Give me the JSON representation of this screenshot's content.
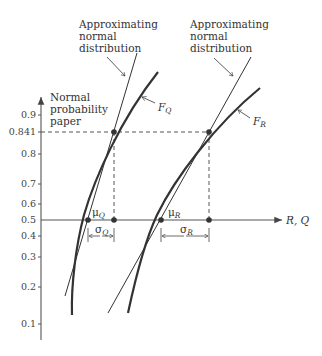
{
  "labels": {
    "approx_left": [
      "Approximating",
      "normal",
      "distribution"
    ],
    "approx_right": [
      "Approximating",
      "normal",
      "distribution"
    ],
    "y_axis_title": [
      "Normal",
      "probability",
      "paper"
    ],
    "x_axis": "R, Q",
    "FQ": "F",
    "FQ_sub": "Q",
    "FR": "F",
    "FR_sub": "R",
    "muQ": "μ",
    "muQ_sub": "Q",
    "muR": "μ",
    "muR_sub": "R",
    "sigmaQ": "σ",
    "sigmaQ_sub": "Q",
    "sigmaR": "σ",
    "sigmaR_sub": "R"
  },
  "y_ticks": [
    "0.9",
    "0.841",
    "0.8",
    "0.7",
    "0.6",
    "0.5",
    "0.4",
    "0.3",
    "0.2",
    "0.1"
  ],
  "colors": {
    "ink": "#333333",
    "axis": "#555555"
  }
}
